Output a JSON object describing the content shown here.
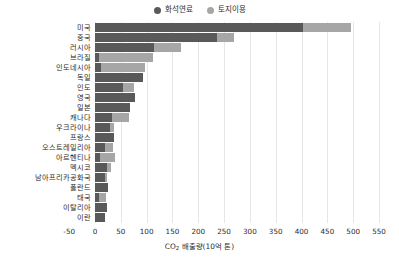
{
  "chart_data": {
    "type": "bar",
    "orientation": "horizontal",
    "stacked": true,
    "title": "",
    "xlabel": "CO2 배출량(10억 톤)",
    "ylabel": "",
    "xlim": [
      -50,
      550
    ],
    "xticks": [
      -50,
      0,
      50,
      100,
      150,
      200,
      250,
      300,
      350,
      400,
      450,
      500,
      550
    ],
    "xtick_labels": [
      "-50",
      "0",
      "50",
      "100",
      "150",
      "200",
      "250",
      "300",
      "350",
      "400",
      "450",
      "500",
      "550"
    ],
    "grid": true,
    "legend_position": "top-center",
    "categories": [
      "미국",
      "중국",
      "러시아",
      "브라질",
      "인도네시아",
      "독일",
      "인도",
      "영국",
      "일본",
      "캐나다",
      "우크라이나",
      "프랑스",
      "오스트레일리아",
      "아르헨티나",
      "멕시코",
      "남아프리카공화국",
      "폴란드",
      "태국",
      "이탈리아",
      "이란"
    ],
    "series": [
      {
        "name": "화석연료",
        "color": "#595959",
        "values": [
          403,
          236,
          115,
          8,
          12,
          92,
          54,
          78,
          68,
          33,
          30,
          37,
          19,
          10,
          23,
          20,
          26,
          7,
          23,
          19
        ]
      },
      {
        "name": "토지이용",
        "color": "#a6a6a6",
        "values": [
          93,
          34,
          52,
          104,
          84,
          0,
          22,
          0,
          0,
          32,
          6,
          0,
          16,
          28,
          8,
          4,
          0,
          14,
          0,
          0
        ]
      }
    ],
    "totals": [
      496,
      270,
      167,
      112,
      96,
      92,
      76,
      78,
      68,
      65,
      36,
      37,
      35,
      38,
      31,
      24,
      26,
      21,
      23,
      19
    ]
  },
  "legend": {
    "items": [
      {
        "label": "화석연료",
        "color": "#595959"
      },
      {
        "label": "토지이용",
        "color": "#a6a6a6"
      }
    ]
  },
  "axis": {
    "x_title_main": "CO",
    "x_title_sub": "2",
    "x_title_rest": " 배출량(10억 톤)"
  }
}
